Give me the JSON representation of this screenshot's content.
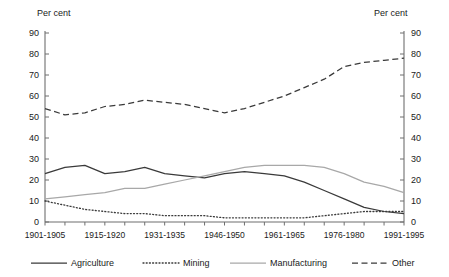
{
  "axis": {
    "left_unit": "Per cent",
    "right_unit": "Per cent",
    "y_ticks": [
      "90",
      "80",
      "70",
      "60",
      "50",
      "40",
      "30",
      "20",
      "10",
      "0"
    ]
  },
  "x_axis": {
    "labels": [
      "1901-1905",
      "1915-1920",
      "1931-1935",
      "1946-1950",
      "1961-1965",
      "1976-1980",
      "1991-1995"
    ]
  },
  "legend": {
    "items": [
      {
        "label": "Agriculture",
        "style": "solid",
        "color": "#3a3a3a"
      },
      {
        "label": "Mining",
        "style": "dotted",
        "color": "#3a3a3a"
      },
      {
        "label": "Manufacturing",
        "style": "solid",
        "color": "#a8a8a8"
      },
      {
        "label": "Other",
        "style": "dashed",
        "color": "#3a3a3a"
      }
    ]
  },
  "chart_data": {
    "type": "line",
    "title": "",
    "subtitle": "",
    "xlabel": "",
    "ylabel": "Per cent",
    "y2label": "Per cent",
    "ylim": [
      0,
      90
    ],
    "ytick_step": 10,
    "grid": false,
    "legend_position": "bottom",
    "categories": [
      "1901-1905",
      "1906-1910",
      "1911-1915",
      "1915-1920",
      "1921-1925",
      "1926-1930",
      "1931-1935",
      "1936-1940",
      "1941-1945",
      "1946-1950",
      "1951-1955",
      "1956-1960",
      "1961-1965",
      "1966-1970",
      "1971-1975",
      "1976-1980",
      "1981-1985",
      "1986-1990",
      "1991-1995"
    ],
    "series": [
      {
        "name": "Agriculture",
        "style": "solid",
        "color": "#3a3a3a",
        "values": [
          23,
          26,
          27,
          23,
          24,
          26,
          23,
          22,
          21,
          23,
          24,
          23,
          22,
          19,
          15,
          11,
          7,
          5,
          4
        ]
      },
      {
        "name": "Mining",
        "style": "dotted",
        "color": "#3a3a3a",
        "values": [
          10,
          8,
          6,
          5,
          4,
          4,
          3,
          3,
          3,
          2,
          2,
          2,
          2,
          2,
          3,
          4,
          5,
          5,
          5
        ]
      },
      {
        "name": "Manufacturing",
        "style": "solid",
        "color": "#a8a8a8",
        "values": [
          11,
          12,
          13,
          14,
          16,
          16,
          18,
          20,
          22,
          24,
          26,
          27,
          27,
          27,
          26,
          23,
          19,
          17,
          14
        ]
      },
      {
        "name": "Other",
        "style": "dashed",
        "color": "#3a3a3a",
        "values": [
          54,
          51,
          52,
          55,
          56,
          58,
          57,
          56,
          54,
          52,
          54,
          57,
          60,
          64,
          68,
          74,
          76,
          77,
          78
        ]
      }
    ]
  }
}
